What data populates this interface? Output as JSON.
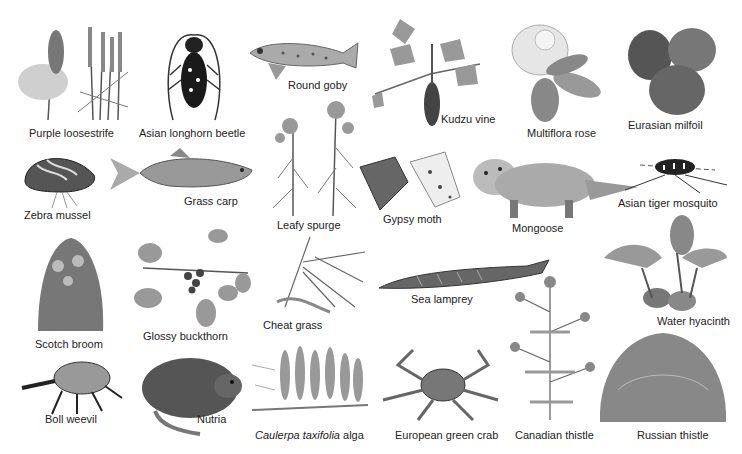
{
  "figure": {
    "style": "grayscale illustrations",
    "background": "#ffffff",
    "species": [
      {
        "id": "purple-loosestrife",
        "label": "Purple loosestrife"
      },
      {
        "id": "asian-longhorn-beetle",
        "label": "Asian longhorn beetle"
      },
      {
        "id": "round-goby",
        "label": "Round goby"
      },
      {
        "id": "kudzu-vine",
        "label": "Kudzu vine"
      },
      {
        "id": "multiflora-rose",
        "label": "Multiflora rose"
      },
      {
        "id": "eurasian-milfoil",
        "label": "Eurasian milfoil"
      },
      {
        "id": "zebra-mussel",
        "label": "Zebra mussel"
      },
      {
        "id": "grass-carp",
        "label": "Grass carp"
      },
      {
        "id": "leafy-spurge",
        "label": "Leafy spurge"
      },
      {
        "id": "gypsy-moth",
        "label": "Gypsy moth"
      },
      {
        "id": "mongoose",
        "label": "Mongoose"
      },
      {
        "id": "asian-tiger-mosquito",
        "label": "Asian tiger mosquito"
      },
      {
        "id": "scotch-broom",
        "label": "Scotch broom"
      },
      {
        "id": "glossy-buckthorn",
        "label": "Glossy buckthorn"
      },
      {
        "id": "cheat-grass",
        "label": "Cheat grass"
      },
      {
        "id": "sea-lamprey",
        "label": "Sea lamprey"
      },
      {
        "id": "water-hyacinth",
        "label": "Water hyacinth"
      },
      {
        "id": "boll-weevil",
        "label": "Boll weevil"
      },
      {
        "id": "nutria",
        "label": "Nutria"
      },
      {
        "id": "caulerpa",
        "label_italic": "Caulerpa taxifolia",
        "label_rest": " alga"
      },
      {
        "id": "european-green-crab",
        "label": "European green crab"
      },
      {
        "id": "canadian-thistle",
        "label": "Canadian thistle"
      },
      {
        "id": "russian-thistle",
        "label": "Russian thistle"
      }
    ]
  }
}
